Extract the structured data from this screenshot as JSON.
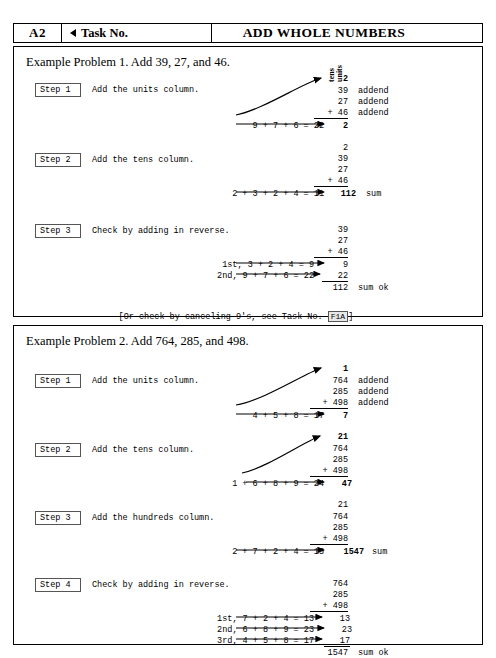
{
  "header": {
    "code": "A2",
    "task_label": "Task No.",
    "back_icon": "triangle-left-icon",
    "title": "ADD WHOLE NUMBERS"
  },
  "column_labels": {
    "tens": "tens",
    "units": "units"
  },
  "example1": {
    "title": "Example Problem 1.  Add 39, 27, and 46.",
    "steps": [
      {
        "label": "Step 1",
        "text": "Add the units column.",
        "equation": "9 + 7 + 6 = 22",
        "carry": "2",
        "numbers": [
          "39",
          "27",
          "+ 46"
        ],
        "tags": [
          "addend",
          "addend",
          "addend"
        ],
        "result": "2",
        "result_tag": ""
      },
      {
        "label": "Step 2",
        "text": "Add the tens column.",
        "equation": "2 + 3 + 2 + 4 = 11",
        "carry": "2",
        "numbers": [
          "39",
          "27",
          "+ 46"
        ],
        "tags": [
          "",
          "",
          ""
        ],
        "result": "112",
        "result_tag": "sum"
      },
      {
        "label": "Step 3",
        "text": "Check by adding in reverse.",
        "numbers": [
          "39",
          "27",
          "+ 46"
        ],
        "check_lines": [
          {
            "equation": "1st, 3 + 2 + 4 = 9",
            "result": "9"
          },
          {
            "equation": "2nd, 9 + 7 + 6 = 22",
            "result": "22"
          }
        ],
        "total": "112",
        "total_tag": "sum ok"
      }
    ],
    "note_prefix": "[Or check by canceling 9's, see Task No. ",
    "note_ref": "F1A",
    "note_suffix": "]"
  },
  "example2": {
    "title": "Example Problem 2.  Add 764, 285, and 498.",
    "steps": [
      {
        "label": "Step 1",
        "text": "Add the units column.",
        "equation": "4 + 5 + 8 = 17",
        "carry": "1",
        "numbers": [
          "764",
          "285",
          "+ 498"
        ],
        "tags": [
          "addend",
          "addend",
          "addend"
        ],
        "result": "7",
        "result_tag": ""
      },
      {
        "label": "Step 2",
        "text": "Add the tens column.",
        "equation": "1 + 6 + 8 + 9 = 24",
        "carry": "21",
        "numbers": [
          "764",
          "285",
          "+ 498"
        ],
        "tags": [
          "",
          "",
          ""
        ],
        "result": "47",
        "result_tag": ""
      },
      {
        "label": "Step 3",
        "text": "Add the hundreds column.",
        "equation": "2 + 7 + 2 + 4 = 15",
        "carry": "21",
        "numbers": [
          "764",
          "285",
          "+ 498"
        ],
        "tags": [
          "",
          "",
          ""
        ],
        "result": "1547",
        "result_tag": "sum"
      },
      {
        "label": "Step 4",
        "text": "Check by adding in reverse.",
        "numbers": [
          "764",
          "285",
          "+ 498"
        ],
        "check_lines": [
          {
            "equation": "1st, 7 + 2 + 4 = 13",
            "result": "13"
          },
          {
            "equation": "2nd, 6 + 8 + 9 = 23",
            "result": "23"
          },
          {
            "equation": "3rd, 4 + 5 + 8 = 17",
            "result": "17"
          }
        ],
        "total": "1547",
        "total_tag": "sum ok"
      }
    ]
  }
}
